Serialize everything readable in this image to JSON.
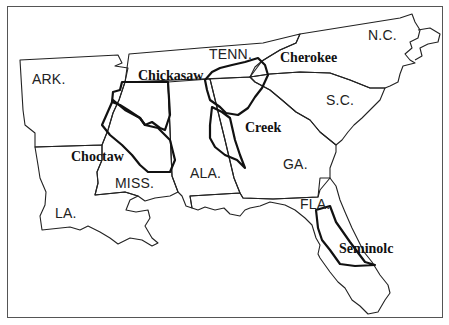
{
  "map": {
    "subject": "Southeastern United States with Native American tribal territories",
    "colors": {
      "background": "#ffffff",
      "state_border": "#222222",
      "tribe_border": "#111111",
      "frame": "#555555"
    },
    "states": [
      {
        "id": "ark",
        "label": "ARK."
      },
      {
        "id": "tenn",
        "label": "TENN."
      },
      {
        "id": "nc",
        "label": "N.C."
      },
      {
        "id": "sc",
        "label": "S.C."
      },
      {
        "id": "miss",
        "label": "MISS."
      },
      {
        "id": "ala",
        "label": "ALA."
      },
      {
        "id": "ga",
        "label": "GA."
      },
      {
        "id": "la",
        "label": "LA."
      },
      {
        "id": "fla",
        "label": "FLA."
      }
    ],
    "tribes": [
      {
        "id": "chickasaw",
        "label": "Chickasaw"
      },
      {
        "id": "cherokee",
        "label": "Cherokee"
      },
      {
        "id": "creek",
        "label": "Creek"
      },
      {
        "id": "choctaw",
        "label": "Choctaw"
      },
      {
        "id": "seminole",
        "label": "Seminolc"
      }
    ]
  }
}
